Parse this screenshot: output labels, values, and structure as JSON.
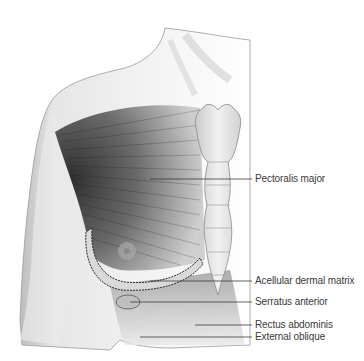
{
  "figure": {
    "background": "#ffffff",
    "line_color": "#3a3a3a"
  },
  "labels": [
    {
      "id": "pectoralis-major",
      "text": "Pectoralis major",
      "x": 255,
      "y": 173,
      "line_from_x": 150,
      "line_y": 179
    },
    {
      "id": "acellular-dermal-matrix",
      "text": "Acellular dermal matrix",
      "x": 255,
      "y": 275,
      "line_from_x": 150,
      "line_y": 281
    },
    {
      "id": "serratus-anterior",
      "text": "Serratus anterior",
      "x": 255,
      "y": 296,
      "line_from_x": 130,
      "line_y": 302
    },
    {
      "id": "rectus-abdominis",
      "text": "Rectus abdominis",
      "x": 255,
      "y": 319,
      "line_from_x": 195,
      "line_y": 325
    },
    {
      "id": "external-oblique",
      "text": "External oblique",
      "x": 255,
      "y": 331,
      "line_from_x": 140,
      "line_y": 337
    }
  ]
}
